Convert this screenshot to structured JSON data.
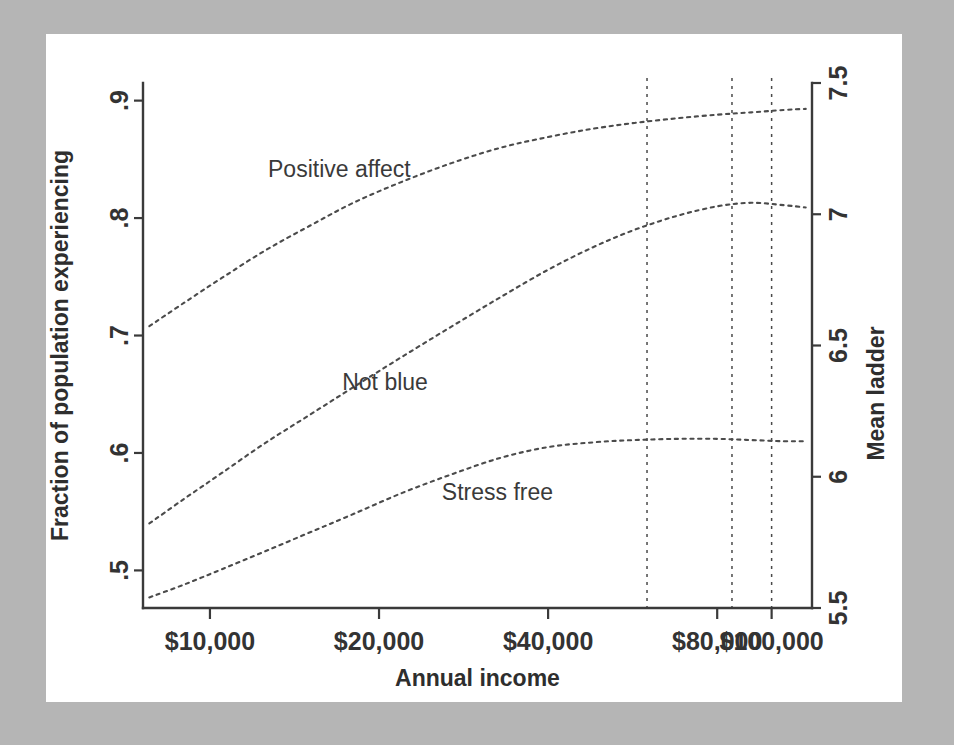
{
  "chart_data": {
    "type": "line",
    "title": "",
    "xlabel": "Annual income",
    "ylabel": "Fraction of population experiencing",
    "y2label": "Mean ladder",
    "xscale": "log",
    "xlim": [
      7600,
      118000
    ],
    "ylim": [
      0.468,
      0.915
    ],
    "y2lim": [
      5.5,
      7.5
    ],
    "grid": false,
    "legend_position": "inline-annotations",
    "xticks": [
      {
        "value": 10000,
        "label": "$10,000"
      },
      {
        "value": 20000,
        "label": "$20,000"
      },
      {
        "value": 40000,
        "label": "$40,000"
      },
      {
        "value": 80000,
        "label": "$80,000"
      },
      {
        "value": 100000,
        "label": "$100,000"
      }
    ],
    "yticks": [
      {
        "value": 0.5,
        "label": ".5"
      },
      {
        "value": 0.6,
        "label": ".6"
      },
      {
        "value": 0.7,
        "label": ".7"
      },
      {
        "value": 0.8,
        "label": ".8"
      },
      {
        "value": 0.9,
        "label": ".9"
      }
    ],
    "y2ticks": [
      {
        "value": 5.5,
        "label": "5.5"
      },
      {
        "value": 6.0,
        "label": "6"
      },
      {
        "value": 6.5,
        "label": "6.5"
      },
      {
        "value": 7.0,
        "label": "7"
      },
      {
        "value": 7.5,
        "label": "7.5"
      }
    ],
    "reference_lines": [
      {
        "x": 60000,
        "style": "dashed"
      },
      {
        "x": 85000,
        "style": "dashed"
      },
      {
        "x": 100000,
        "style": "dashed"
      }
    ],
    "series": [
      {
        "name": "Positive affect",
        "axis": "left",
        "label_x": 17000,
        "label_y": 0.835,
        "x": [
          7800,
          9000,
          10500,
          12500,
          15000,
          18000,
          22000,
          27000,
          33000,
          40000,
          48000,
          57000,
          68000,
          80000,
          92000,
          105000,
          115000
        ],
        "y": [
          0.708,
          0.728,
          0.749,
          0.772,
          0.793,
          0.813,
          0.831,
          0.847,
          0.86,
          0.869,
          0.876,
          0.881,
          0.885,
          0.888,
          0.89,
          0.892,
          0.893
        ]
      },
      {
        "name": "Not blue",
        "axis": "left",
        "label_x": 20500,
        "label_y": 0.654,
        "x": [
          7800,
          9000,
          10500,
          12500,
          15000,
          18000,
          22000,
          27000,
          33000,
          40000,
          48000,
          57000,
          68000,
          80000,
          92000,
          105000,
          115000
        ],
        "y": [
          0.54,
          0.561,
          0.583,
          0.608,
          0.632,
          0.656,
          0.682,
          0.708,
          0.733,
          0.756,
          0.775,
          0.79,
          0.802,
          0.81,
          0.813,
          0.811,
          0.809
        ]
      },
      {
        "name": "Stress free",
        "axis": "left",
        "label_x": 32500,
        "label_y": 0.56,
        "x": [
          7800,
          9000,
          10500,
          12500,
          15000,
          18000,
          22000,
          27000,
          33000,
          40000,
          48000,
          57000,
          68000,
          80000,
          92000,
          105000,
          115000
        ],
        "y": [
          0.477,
          0.488,
          0.501,
          0.516,
          0.532,
          0.548,
          0.566,
          0.582,
          0.596,
          0.605,
          0.609,
          0.611,
          0.612,
          0.612,
          0.611,
          0.61,
          0.61
        ]
      }
    ]
  },
  "colors": {
    "background": "#b5b5b5",
    "panel": "#ffffff",
    "ink": "#3a3a3a",
    "series": "#4b4b4b"
  }
}
